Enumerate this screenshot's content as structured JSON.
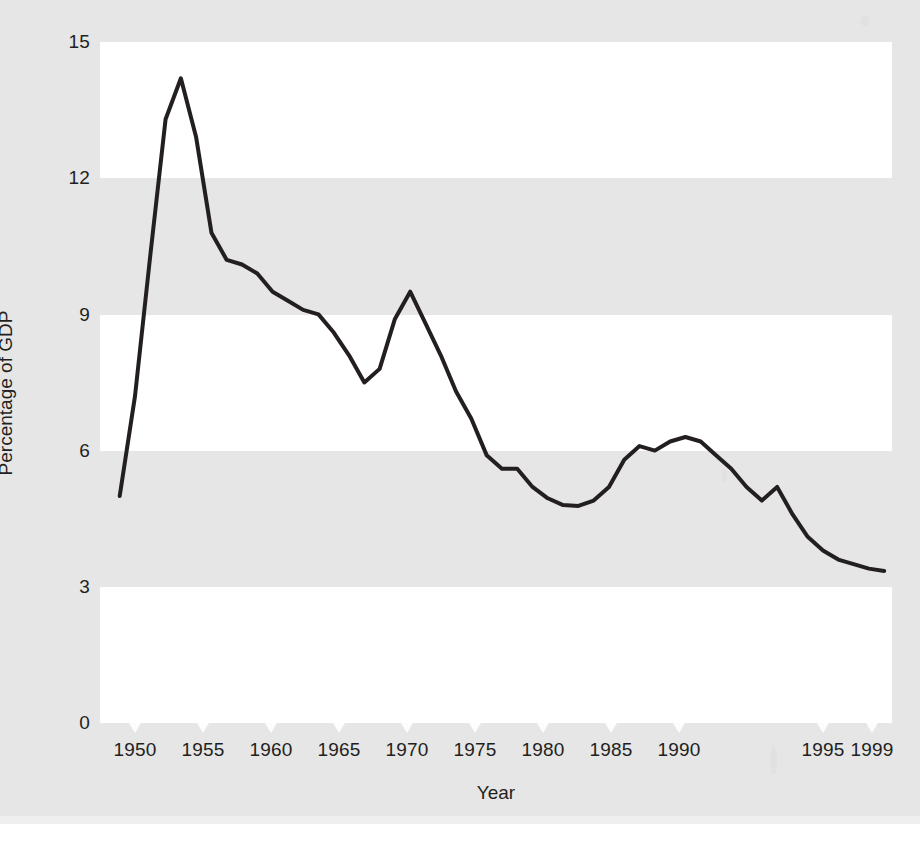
{
  "chart_data": {
    "type": "line",
    "title": "",
    "xlabel": "Year",
    "ylabel": "Percentage of GDP",
    "xlim": [
      1949,
      1999
    ],
    "ylim": [
      0,
      15
    ],
    "grid": false,
    "banded_background": true,
    "band_color": "#e6e6e6",
    "plot_color": "#ffffff",
    "legend": null,
    "line_color": "#231f20",
    "line_width": 4,
    "y_ticks": [
      15,
      12,
      9,
      6,
      3,
      0
    ],
    "y_tick_labels": [
      "15",
      "12",
      "9",
      "6",
      "3",
      "0"
    ],
    "x_ticks": [
      1950,
      1955,
      1960,
      1965,
      1970,
      1975,
      1980,
      1985,
      1990,
      1995,
      1999
    ],
    "x_tick_labels": [
      "1950",
      "1955",
      "1960",
      "1965",
      "1970",
      "1975",
      "1980",
      "1985",
      "1990",
      "1995",
      "1999"
    ],
    "series": [
      {
        "name": "Percentage of GDP",
        "x": [
          1949,
          1950,
          1951,
          1952,
          1953,
          1954,
          1955,
          1956,
          1957,
          1958,
          1959,
          1960,
          1961,
          1962,
          1963,
          1964,
          1965,
          1966,
          1967,
          1968,
          1969,
          1970,
          1971,
          1972,
          1973,
          1974,
          1975,
          1976,
          1977,
          1978,
          1979,
          1980,
          1981,
          1982,
          1983,
          1984,
          1985,
          1986,
          1987,
          1988,
          1989,
          1990,
          1991,
          1992,
          1993,
          1994,
          1995,
          1996,
          1997,
          1998,
          1999
        ],
        "y": [
          5.0,
          7.2,
          10.3,
          13.3,
          14.2,
          12.9,
          10.8,
          10.2,
          10.1,
          9.9,
          9.5,
          9.3,
          9.1,
          9.0,
          8.6,
          8.1,
          7.5,
          7.8,
          8.9,
          9.5,
          8.8,
          8.1,
          7.3,
          6.7,
          5.9,
          5.6,
          5.6,
          5.2,
          4.95,
          4.8,
          4.78,
          4.9,
          5.2,
          5.8,
          6.1,
          6.0,
          6.2,
          6.3,
          6.2,
          5.9,
          5.6,
          5.2,
          4.9,
          5.2,
          4.6,
          4.1,
          3.8,
          3.6,
          3.5,
          3.4,
          3.35
        ],
        "color": "#231f20"
      }
    ],
    "annotations": [],
    "notable_points": {
      "start_1949": 5.0,
      "peak_1953": 14.2,
      "local_min_1965": 7.5,
      "local_peak_1968": 9.5,
      "local_min_1979": 4.78,
      "local_peak_1986": 6.3,
      "local_min_1991": 4.9,
      "local_peak_1992": 5.2,
      "end_1999": 3.35
    }
  },
  "axes": {
    "y_title": "Percentage of GDP",
    "x_title": "Year"
  },
  "icons": {
    "x_tick_marker": "triangle-down-icon"
  }
}
